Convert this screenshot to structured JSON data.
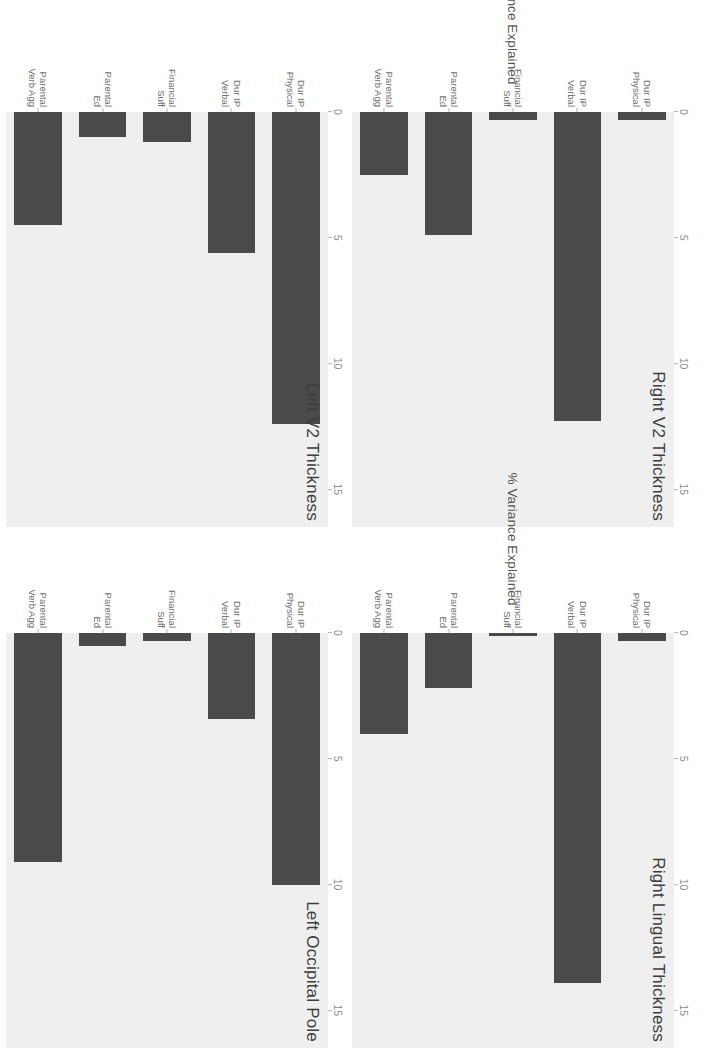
{
  "figure": {
    "axis_label": "% Variance Explained",
    "bar_color": "#4a4a4a",
    "panel_background": "#efefef",
    "page_background": "#ffffff"
  },
  "chart_data": {
    "type": "bar",
    "orientation": "horizontal",
    "title": "",
    "xlabel": "% Variance Explained",
    "ylabel": "",
    "xlim": [
      0,
      16.5
    ],
    "xticks": [
      0,
      5,
      10,
      15
    ],
    "xticklabels": [
      "0",
      "5",
      "10",
      "15"
    ],
    "grid": false,
    "legend": null,
    "categories": [
      "Dur IP Physical",
      "Dur IP Verbal",
      "Financial Suff",
      "Parental Ed",
      "Parental Verb Agg"
    ],
    "category_lines": [
      [
        "Dur IP",
        "Physical"
      ],
      [
        "Dur IP",
        "Verbal"
      ],
      [
        "Financial",
        "Suff"
      ],
      [
        "Parental",
        "Ed"
      ],
      [
        "Parental",
        "Verb Agg"
      ]
    ],
    "panels": [
      {
        "title": "Right V2 Thickness",
        "values": [
          0.3,
          12.3,
          0.3,
          4.9,
          2.5
        ]
      },
      {
        "title": "Right Lingual Thickness",
        "values": [
          0.3,
          13.9,
          0.1,
          2.2,
          4.0
        ]
      },
      {
        "title": "Left V2 Thickness",
        "values": [
          12.4,
          5.6,
          1.2,
          1.0,
          4.5
        ]
      },
      {
        "title": "Left Occipital Pole",
        "values": [
          10.0,
          3.4,
          0.3,
          0.5,
          9.1
        ]
      }
    ]
  }
}
